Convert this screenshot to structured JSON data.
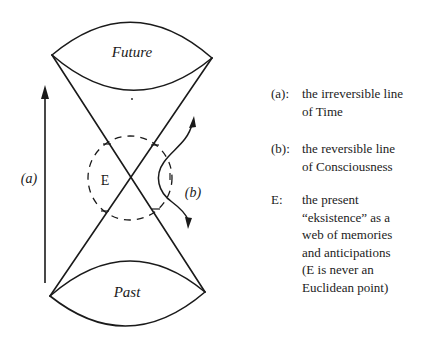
{
  "diagram": {
    "cone_labels": {
      "future": "Future",
      "past": "Past"
    },
    "axis_labels": {
      "a": "(a)",
      "b": "(b)",
      "e": "E"
    },
    "colors": {
      "stroke": "#1a1a1a",
      "background": "#ffffff"
    }
  },
  "legend": {
    "items": [
      {
        "key": "(a):",
        "lines": [
          "the irreversible line",
          "of Time"
        ]
      },
      {
        "key": "(b):",
        "lines": [
          "the reversible line",
          "of Consciousness"
        ]
      },
      {
        "key": "E:",
        "lines": [
          "the present",
          "“eksistence” as a",
          "web of memories",
          "and anticipations",
          "(E is never an",
          "Euclidean point)"
        ]
      }
    ]
  }
}
